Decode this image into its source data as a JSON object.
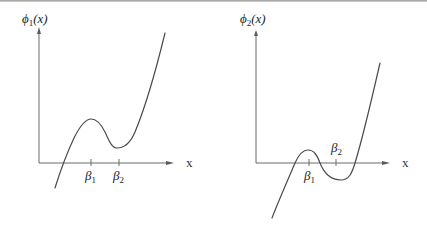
{
  "figure": {
    "panels": [
      {
        "id": "phi1",
        "y_label": {
          "main": "ϕ",
          "sub": "1",
          "arg": "(x)"
        },
        "x_label": "x",
        "ticks": [
          {
            "main": "β",
            "sub": "1"
          },
          {
            "main": "β",
            "sub": "2"
          }
        ],
        "description": "Cubic-like curve with local max at β1 and local min at β2, both above x-axis; single real root left of β1"
      },
      {
        "id": "phi2",
        "y_label": {
          "main": "ϕ",
          "sub": "2",
          "arg": "(x)"
        },
        "x_label": "x",
        "ticks": [
          {
            "main": "β",
            "sub": "1"
          },
          {
            "main": "β",
            "sub": "2"
          }
        ],
        "description": "Cubic-like curve with local max near β1 above x-axis and local min near β2 below x-axis; three real roots"
      }
    ],
    "colors": {
      "axis": "#6b6b6b",
      "curve": "#4a4a4a",
      "text": "#222222",
      "background": "#ffffff"
    }
  }
}
